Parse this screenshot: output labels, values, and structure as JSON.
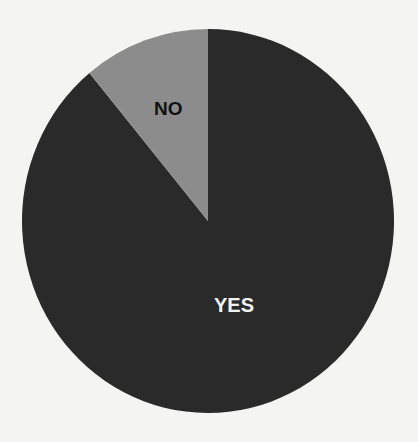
{
  "chart_data": {
    "type": "pie",
    "title": "",
    "categories": [
      "YES",
      "NO"
    ],
    "values": [
      89,
      11
    ],
    "units": "percent (estimated)",
    "colors": {
      "YES": "#2a2a2a",
      "NO": "#8c8c8c"
    },
    "label_colors": {
      "YES": "#f2f2f2",
      "NO": "#111111"
    },
    "start_angle": "12 o'clock, NO slice counter-clockwise",
    "legend": "none (labels inside slices)"
  },
  "labels": {
    "yes": "YES",
    "no": "NO"
  }
}
